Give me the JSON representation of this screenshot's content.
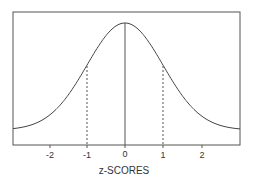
{
  "chart_data": {
    "type": "line",
    "title": "",
    "xlabel": "z-SCORES",
    "ylabel": "",
    "x_ticks": [
      "-2",
      "-1",
      "0",
      "1",
      "2"
    ],
    "xlim": [
      -3,
      3
    ],
    "series": [
      {
        "name": "standard normal curve",
        "function": "normal_pdf",
        "mean": 0,
        "sd": 1
      }
    ],
    "annotations": [
      {
        "type": "solid_vertical_line",
        "x": 0
      },
      {
        "type": "dashed_vertical_line",
        "x": -1
      },
      {
        "type": "dashed_vertical_line",
        "x": 1
      }
    ],
    "grid": false,
    "legend": "none"
  },
  "axis": {
    "ticks": [
      "-2",
      "-1",
      "0",
      "1",
      "2"
    ],
    "label": "z-SCORES"
  }
}
